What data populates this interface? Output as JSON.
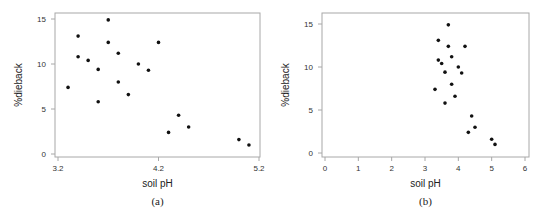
{
  "chart_data": [
    {
      "panel": "a",
      "type": "scatter",
      "caption": "(a)",
      "title": "",
      "xlabel": "soil pH",
      "ylabel": "%dieback",
      "xlim": [
        3.2,
        5.2
      ],
      "ylim": [
        0,
        15
      ],
      "xticks": [
        "3.2",
        "4.2",
        "5.2"
      ],
      "xtick_values": [
        3.2,
        4.2,
        5.2
      ],
      "yticks": [
        "0",
        "5",
        "10",
        "15"
      ],
      "ytick_values": [
        0,
        5,
        10,
        15
      ],
      "grid": false,
      "legend": null,
      "x": [
        3.3,
        3.4,
        3.4,
        3.5,
        3.6,
        3.6,
        3.7,
        3.7,
        3.8,
        3.8,
        3.9,
        4.0,
        4.1,
        4.2,
        4.3,
        4.4,
        4.5,
        5.0,
        5.1
      ],
      "y": [
        7.4,
        13.1,
        10.8,
        10.4,
        9.4,
        5.8,
        14.9,
        12.4,
        11.2,
        8.0,
        6.6,
        10.0,
        9.3,
        12.4,
        2.4,
        4.3,
        3.0,
        1.6,
        1.0
      ],
      "frame": {
        "left": 55,
        "top": 13,
        "right": 260,
        "bottom": 157
      },
      "map": {
        "x0": 58,
        "xv0": 3.2,
        "x1": 259,
        "xv1": 5.2,
        "y0": 154,
        "yv0": 0,
        "y1": 19,
        "yv1": 15
      }
    },
    {
      "panel": "b",
      "type": "scatter",
      "caption": "(b)",
      "title": "",
      "xlabel": "soil pH",
      "ylabel": "%dieback",
      "xlim": [
        0,
        6
      ],
      "ylim": [
        0,
        15
      ],
      "xticks": [
        "0",
        "1",
        "2",
        "3",
        "4",
        "5",
        "6"
      ],
      "xtick_values": [
        0,
        1,
        2,
        3,
        4,
        5,
        6
      ],
      "yticks": [
        "0",
        "5",
        "10",
        "15"
      ],
      "ytick_values": [
        0,
        5,
        10,
        15
      ],
      "grid": false,
      "legend": null,
      "x": [
        3.3,
        3.4,
        3.4,
        3.5,
        3.6,
        3.6,
        3.7,
        3.7,
        3.8,
        3.8,
        3.9,
        4.0,
        4.1,
        4.2,
        4.3,
        4.4,
        4.5,
        5.0,
        5.1
      ],
      "y": [
        7.4,
        13.1,
        10.8,
        10.4,
        9.4,
        5.8,
        14.9,
        12.4,
        11.2,
        8.0,
        6.6,
        10.0,
        9.3,
        12.4,
        2.4,
        4.3,
        3.0,
        1.6,
        1.0
      ],
      "frame": {
        "left": 322,
        "top": 13,
        "right": 529,
        "bottom": 157
      },
      "map": {
        "x0": 325,
        "xv0": 0,
        "x1": 525,
        "xv1": 6,
        "y0": 153,
        "yv0": 0,
        "y1": 24,
        "yv1": 15
      }
    }
  ]
}
